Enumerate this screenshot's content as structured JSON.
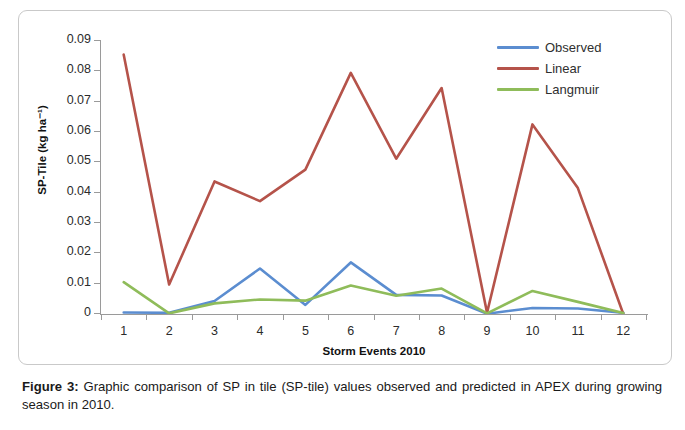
{
  "figure": {
    "caption_label": "Figure 3:",
    "caption_text": " Graphic comparison of SP in tile (SP-tile) values observed and predicted in APEX during growing season in 2010."
  },
  "axis": {
    "y_title": "SP-Tile (kg ha⁻¹)",
    "x_title": "Storm Events 2010"
  },
  "legend": {
    "items": [
      {
        "label": "Observed",
        "color": "#5B8DD0"
      },
      {
        "label": "Linear",
        "color": "#B5534A"
      },
      {
        "label": "Langmuir",
        "color": "#8FBC5A"
      }
    ]
  },
  "chart_data": {
    "type": "line",
    "title": "",
    "xlabel": "Storm Events 2010",
    "ylabel": "SP-Tile (kg ha⁻¹)",
    "categories": [
      "1",
      "2",
      "3",
      "4",
      "5",
      "6",
      "7",
      "8",
      "9",
      "10",
      "11",
      "12"
    ],
    "x": [
      1,
      2,
      3,
      4,
      5,
      6,
      7,
      8,
      9,
      10,
      11,
      12
    ],
    "ylim": [
      0,
      0.09
    ],
    "xlim": [
      0.5,
      12.5
    ],
    "yticks": [
      0,
      0.01,
      0.02,
      0.03,
      0.04,
      0.05,
      0.06,
      0.07,
      0.08,
      0.09
    ],
    "ytick_labels": [
      "0",
      "0.01",
      "0.02",
      "0.03",
      "0.04",
      "0.05",
      "0.06",
      "0.07",
      "0.08",
      "0.09"
    ],
    "grid": false,
    "legend_position": "top-right",
    "series": [
      {
        "name": "Observed",
        "color": "#5B8DD0",
        "values": [
          0.0005,
          0.0004,
          0.0043,
          0.015,
          0.003,
          0.017,
          0.0063,
          0.0061,
          0.0001,
          0.002,
          0.0018,
          0.0004
        ]
      },
      {
        "name": "Linear",
        "color": "#B5534A",
        "values": [
          0.0855,
          0.0097,
          0.0437,
          0.0372,
          0.0476,
          0.0795,
          0.0512,
          0.0745,
          0.0004,
          0.0625,
          0.0415,
          0.0
        ]
      },
      {
        "name": "Langmuir",
        "color": "#8FBC5A",
        "values": [
          0.0105,
          0.0002,
          0.0035,
          0.0048,
          0.0044,
          0.0094,
          0.006,
          0.0084,
          0.0002,
          0.0076,
          0.004,
          0.0003
        ]
      }
    ]
  }
}
